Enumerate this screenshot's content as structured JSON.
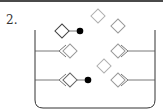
{
  "question": {
    "number_label": "2."
  },
  "diagram": {
    "colors": {
      "outline": "#333333",
      "free_diamond": "#b0b0b0",
      "bound_diamond": "#888888",
      "label_dot": "#000000"
    },
    "container": {
      "left_x": 35,
      "right_x": 155,
      "top_y": 30,
      "bottom_y": 108
    },
    "left_shelves_y": [
      51,
      80
    ],
    "right_shelves_y": [
      51,
      80
    ],
    "free_diamonds": [
      {
        "x": 98,
        "y": 15
      },
      {
        "x": 118,
        "y": 25
      },
      {
        "x": 104,
        "y": 66
      }
    ],
    "labeled_conjugates": [
      {
        "diamond_x": 62,
        "diamond_y": 30,
        "dot_x": 80,
        "dot_y": 30
      },
      {
        "diamond_x": 65,
        "diamond_y": 80,
        "dot_x": 87,
        "dot_y": 80
      }
    ]
  }
}
